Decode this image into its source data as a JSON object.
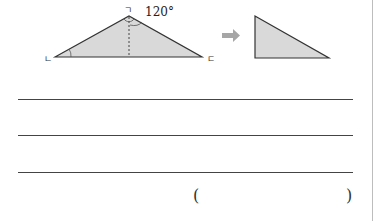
{
  "figure": {
    "angle_label": "120°",
    "vertex_labels": {
      "top": "ㄱ",
      "left": "ㄴ",
      "right": "ㄷ"
    },
    "fill_color": "#d9d9d9",
    "stroke_color": "#333333",
    "arrow_color": "#a6a6a6"
  },
  "answer_lines": 3,
  "answer_parens": {
    "open": "(",
    "close": ")"
  }
}
